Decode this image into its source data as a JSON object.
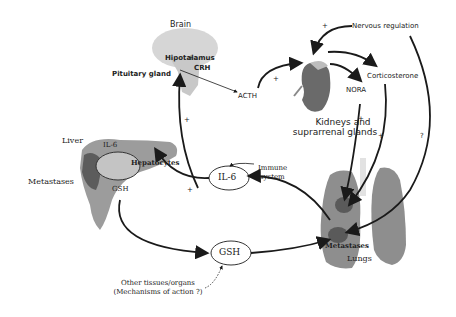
{
  "diagram": {
    "organs": {
      "brain": {
        "title": "Brain",
        "hypothalamus": "Hipotalamus",
        "crh": "CRH",
        "pituitary": "Pituitary gland"
      },
      "acth": "ACTH",
      "kidneys": {
        "line1": "Kidneys and",
        "line2": "suprarrenal glands"
      },
      "nervous": "Nervous regulation",
      "corticosterone": "Corticosterone",
      "nora": "NORA",
      "liver": {
        "title": "Liver",
        "metastases": "Metastases",
        "il6_small": "IL-6",
        "hepatocytes": "Hepatocytes",
        "gsh_small": "GSH"
      },
      "immune": {
        "line1": "Immune",
        "line2": "system"
      },
      "il6": "IL-6",
      "gsh": "GSH",
      "other": {
        "line1": "Other tissues/organs",
        "line2": "(Mechanisms of action ?)"
      },
      "lungs": {
        "title": "Lungs",
        "metastases": "Metastases"
      }
    },
    "signs": {
      "plus": "+",
      "question": "?"
    },
    "colors": {
      "organ_light": "#cfcfcf",
      "organ_mid": "#9a9a9a",
      "organ_dark": "#5e5e5e",
      "arrow": "#1a1a1a"
    }
  }
}
